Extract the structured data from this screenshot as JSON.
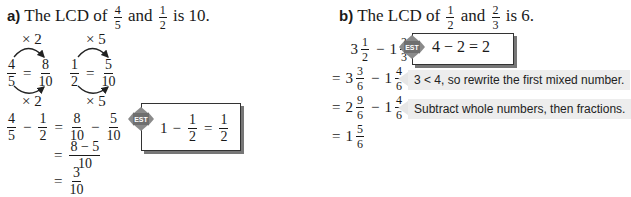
{
  "part_a": {
    "label": "a)",
    "heading_prefix": "The LCD of",
    "frac1": {
      "n": "4",
      "d": "5"
    },
    "and": "and",
    "frac2": {
      "n": "1",
      "d": "2"
    },
    "heading_suffix": "is 10.",
    "multipliers": {
      "left": "× 2",
      "right": "× 5"
    },
    "equiv1": {
      "from": {
        "n": "4",
        "d": "5"
      },
      "to": {
        "n": "8",
        "d": "10"
      }
    },
    "equiv2": {
      "from": {
        "n": "1",
        "d": "2"
      },
      "to": {
        "n": "5",
        "d": "10"
      }
    },
    "steps": {
      "line1": {
        "a": {
          "n": "4",
          "d": "5"
        },
        "b": {
          "n": "1",
          "d": "2"
        },
        "c": {
          "n": "8",
          "d": "10"
        },
        "e": {
          "n": "5",
          "d": "10"
        }
      },
      "line2": {
        "n": "8 − 5",
        "d": "10"
      },
      "line3": {
        "n": "3",
        "d": "10"
      }
    },
    "estimate": {
      "icon_label": "EST",
      "whole": "1",
      "frac": {
        "n": "1",
        "d": "2"
      },
      "result": {
        "n": "1",
        "d": "2"
      }
    }
  },
  "part_b": {
    "label": "b)",
    "heading_prefix": "The LCD of",
    "frac1": {
      "n": "1",
      "d": "2"
    },
    "and": "and",
    "frac2": {
      "n": "2",
      "d": "3"
    },
    "heading_suffix": "is 6.",
    "steps": [
      {
        "prefix": "",
        "w1": "3",
        "f1": {
          "n": "1",
          "d": "2"
        },
        "w2": "1",
        "f2": {
          "n": "2",
          "d": "3"
        }
      },
      {
        "prefix": "=",
        "w1": "3",
        "f1": {
          "n": "3",
          "d": "6"
        },
        "w2": "1",
        "f2": {
          "n": "4",
          "d": "6"
        }
      },
      {
        "prefix": "=",
        "w1": "2",
        "f1": {
          "n": "9",
          "d": "6"
        },
        "w2": "1",
        "f2": {
          "n": "4",
          "d": "6"
        }
      },
      {
        "prefix": "=",
        "w1": "1",
        "f1": {
          "n": "5",
          "d": "6"
        }
      }
    ],
    "estimate": {
      "icon_label": "EST",
      "expr": "4 − 2 = 2"
    },
    "notes": [
      "3 < 4, so rewrite the first mixed number.",
      "Subtract whole numbers, then fractions."
    ]
  },
  "symbols": {
    "minus": "−",
    "equals": "="
  }
}
